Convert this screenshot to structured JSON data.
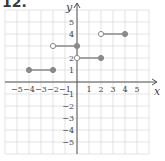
{
  "problem_number": "12.",
  "chart_data": {
    "type": "line",
    "title": "",
    "xlabel": "x",
    "ylabel": "y",
    "xlim": [
      -6,
      6
    ],
    "ylim": [
      -6,
      6
    ],
    "grid": true,
    "x_ticks": [
      -5,
      -4,
      -3,
      -2,
      -1,
      1,
      2,
      3,
      4,
      5
    ],
    "y_ticks": [
      5,
      4,
      3,
      2,
      1,
      -1,
      -2,
      -3,
      -4,
      -5
    ],
    "x_tick_labels": [
      "−5",
      "−4",
      "−3",
      "−2",
      "−1",
      "1",
      "2",
      "3",
      "4",
      "5"
    ],
    "y_tick_labels": [
      "5",
      "4",
      "",
      "2",
      "1",
      "−1",
      "−2",
      "−3",
      "−4",
      "−5"
    ],
    "segments": [
      {
        "x0": -4,
        "x1": -2,
        "y": 1,
        "start": "closed",
        "end": "closed"
      },
      {
        "x0": -2,
        "x1": 0,
        "y": 3,
        "start": "open",
        "end": "closed"
      },
      {
        "x0": 0,
        "x1": 2,
        "y": 2,
        "start": "open",
        "end": "closed"
      },
      {
        "x0": 2,
        "x1": 4,
        "y": 4,
        "start": "open",
        "end": "closed"
      }
    ],
    "colors": {
      "segment": "#8a8a8a",
      "grid": "#dcdcdc",
      "axis": "#555555",
      "point_fill": "#8a8a8a",
      "open_fill": "#ffffff"
    }
  }
}
